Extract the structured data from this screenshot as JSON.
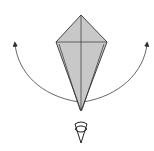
{
  "diagram": {
    "type": "origami-step",
    "colors": {
      "paper_fill": "#c8c8c8",
      "line": "#333333",
      "arrow": "#444444",
      "background": "#ffffff"
    },
    "elements": {
      "kite": "kite-shaped folded paper",
      "crease_vertical": "vertical center crease",
      "crease_horizontal": "horizontal crease across widest point",
      "arrow_left": "curved arrow sweeping up to the left",
      "arrow_right": "curved arrow sweeping up to the right",
      "view_symbol": "eye / viewpoint indicator"
    }
  }
}
